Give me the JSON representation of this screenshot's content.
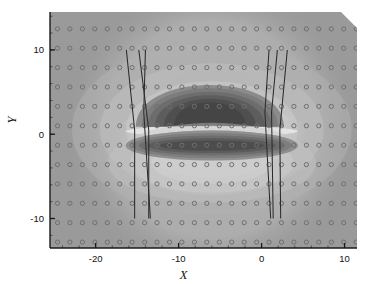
{
  "figure": {
    "type": "contour-field-plot",
    "background_color": "#ffffff",
    "field_base_color": "#9a9a9a",
    "axis_color": "#1a1a1a",
    "line_color": "#2b2b2b",
    "marker_color": "#6f6f6f"
  },
  "axes": {
    "x": {
      "title": "X",
      "tick_labels": [
        "-20",
        "-10",
        "0",
        "10"
      ],
      "tick_values": [
        -20,
        -10,
        0,
        10
      ],
      "range": [
        -25.5,
        11.5
      ]
    },
    "y": {
      "title": "Y",
      "tick_labels": [
        "10",
        "0",
        "-10"
      ],
      "tick_values": [
        10,
        0,
        -10
      ],
      "range": [
        -13.5,
        14.5
      ]
    }
  },
  "chart_data": {
    "type": "heatmap",
    "title": "",
    "xlabel": "X",
    "ylabel": "Y",
    "xlim": [
      -25.5,
      11.5
    ],
    "ylim": [
      -13.5,
      14.5
    ],
    "xticks": [
      -20,
      -10,
      0,
      10
    ],
    "yticks": [
      -10,
      0,
      10
    ],
    "grid": false,
    "legend": "none",
    "colormap": "grayscale",
    "markers": {
      "symbol": "open-circle",
      "x_start": -24.6,
      "x_step": 1.5,
      "x_count": 25,
      "y_start": -12.8,
      "y_step": 2.3,
      "y_count": 12
    },
    "contour_levels": [
      {
        "name": "background",
        "value": 0.5,
        "color": "#9a9a9a"
      },
      {
        "name": "halo-light-1",
        "value": 0.58,
        "color": "#a3a3a3"
      },
      {
        "name": "halo-light-2",
        "value": 0.66,
        "color": "#b0b0b0"
      },
      {
        "name": "halo-light-3",
        "value": 0.74,
        "color": "#bdbdbd"
      },
      {
        "name": "bright-band",
        "value": 0.92,
        "color": "#dcdcdc"
      },
      {
        "name": "mid-dark-1",
        "value": 0.4,
        "color": "#8a8a8a"
      },
      {
        "name": "mid-dark-2",
        "value": 0.3,
        "color": "#757575"
      },
      {
        "name": "dark-core-1",
        "value": 0.18,
        "color": "#5e5e5e"
      },
      {
        "name": "dark-core-2",
        "value": 0.08,
        "color": "#4a4a4a"
      }
    ],
    "field_features": [
      {
        "name": "upper-lobe",
        "shape": "dome",
        "center_x": -6.0,
        "center_y": 3.2,
        "half_width": 8.5,
        "half_height": 3.6
      },
      {
        "name": "bright-separator",
        "shape": "band",
        "center_x": -6.0,
        "center_y": 0.4,
        "half_width": 10.0,
        "half_height": 0.9
      },
      {
        "name": "lower-lobe",
        "shape": "ellipse",
        "center_x": -6.0,
        "center_y": -1.4,
        "half_width": 9.0,
        "half_height": 1.3
      }
    ],
    "trace_lines": {
      "description": "Six near-vertical polylines spanning Y = 10 to Y = -10, three on the left and three on the right, each with a kink near the field lobes.",
      "count": 6,
      "y_top": 10,
      "y_bottom": -10,
      "left_group": [
        {
          "id": "L1",
          "x_top": -16.3,
          "x_kink": -15.3,
          "y_kink": 0.5,
          "x_bottom": -15.3
        },
        {
          "id": "L2",
          "x_top": -14.8,
          "x_kink": -13.6,
          "y_kink": 0.5,
          "x_bottom": -13.6
        },
        {
          "id": "L3",
          "x_top": -14.0,
          "x_kink": -14.2,
          "y_kink": 2.6,
          "x_bottom": -13.4
        }
      ],
      "right_group": [
        {
          "id": "R1",
          "x_top": 0.9,
          "x_kink": 0.4,
          "y_kink": 2.6,
          "x_bottom": 1.1
        },
        {
          "id": "R2",
          "x_top": 1.9,
          "x_kink": 1.2,
          "y_kink": 2.6,
          "x_bottom": 1.4
        },
        {
          "id": "R3",
          "x_top": 3.1,
          "x_kink": 2.2,
          "y_kink": 0.5,
          "x_bottom": 2.3
        }
      ]
    }
  }
}
